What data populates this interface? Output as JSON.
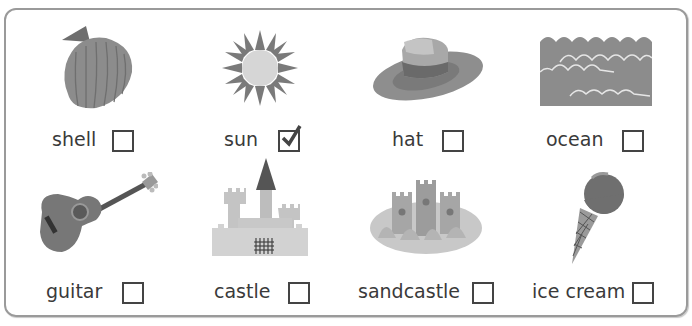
{
  "items": [
    {
      "label": "shell",
      "icon": "shell-icon",
      "checked": false
    },
    {
      "label": "sun",
      "icon": "sun-icon",
      "checked": true
    },
    {
      "label": "hat",
      "icon": "hat-icon",
      "checked": false
    },
    {
      "label": "ocean",
      "icon": "ocean-icon",
      "checked": false
    },
    {
      "label": "guitar",
      "icon": "guitar-icon",
      "checked": false
    },
    {
      "label": "castle",
      "icon": "castle-icon",
      "checked": false
    },
    {
      "label": "sandcastle",
      "icon": "sandcastle-icon",
      "checked": false
    },
    {
      "label": "ice cream",
      "icon": "ice-cream-icon",
      "checked": false
    }
  ],
  "colors": {
    "border": "#9a9a9a",
    "box": "#444444",
    "text": "#3a3a3a"
  }
}
